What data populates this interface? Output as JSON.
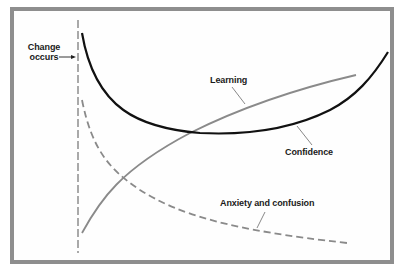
{
  "diagram": {
    "type": "change-curve",
    "labels": {
      "change_line1": "Change",
      "change_line2": "occurs",
      "learning": "Learning",
      "confidence": "Confidence",
      "anxiety": "Anxiety and confusion"
    },
    "curves": [
      {
        "name": "Confidence",
        "style": "solid",
        "color": "#111111",
        "shape": "U-curve: high at change, dips to minimum mid-way, rises steeply at end"
      },
      {
        "name": "Learning",
        "style": "solid",
        "color": "#8a8a8a",
        "shape": "rises from low at change, increasing and leveling"
      },
      {
        "name": "Anxiety and confusion",
        "style": "dashed",
        "color": "#8a8a8a",
        "shape": "high at change, decays toward low"
      }
    ],
    "marker": {
      "name": "Change occurs",
      "style": "dashed vertical line"
    },
    "colors": {
      "frame": "#8e8e8e",
      "confidence": "#111111",
      "learning": "#8a8a8a",
      "anxiety": "#8a8a8a",
      "marker": "#555555"
    }
  }
}
